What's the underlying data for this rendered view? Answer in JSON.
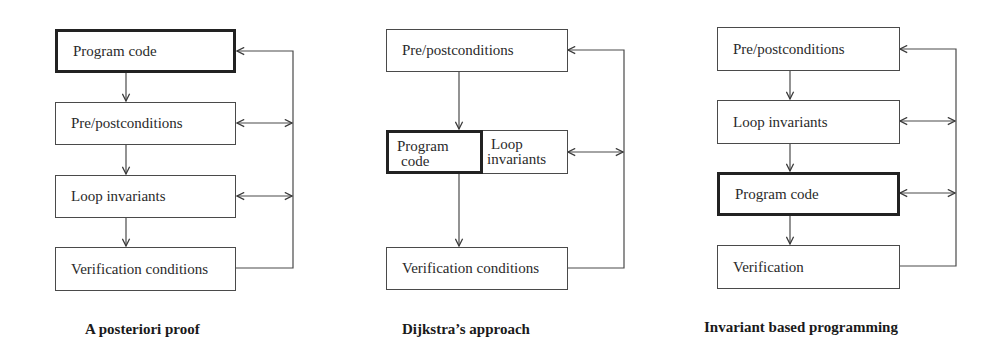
{
  "diagrams": [
    {
      "caption": "A posteriori proof",
      "boxes": [
        {
          "label": "Program code",
          "emphasized": true
        },
        {
          "label": "Pre/postconditions"
        },
        {
          "label": "Loop invariants"
        },
        {
          "label": "Verification conditions"
        }
      ]
    },
    {
      "caption": "Dijkstra’s approach",
      "boxes": [
        {
          "label": "Pre/postconditions"
        },
        {
          "label_line1": "Program",
          "label_line2": "code",
          "emphasized": true
        },
        {
          "label_line1": "Loop",
          "label_line2": "invariants"
        },
        {
          "label": "Verification conditions"
        }
      ]
    },
    {
      "caption": "Invariant based programming",
      "boxes": [
        {
          "label": "Pre/postconditions"
        },
        {
          "label": "Loop invariants"
        },
        {
          "label": "Program code",
          "emphasized": true
        },
        {
          "label": "Verification"
        }
      ]
    }
  ],
  "colors": {
    "line": "#4a4a4a",
    "emphasis": "#222222"
  }
}
